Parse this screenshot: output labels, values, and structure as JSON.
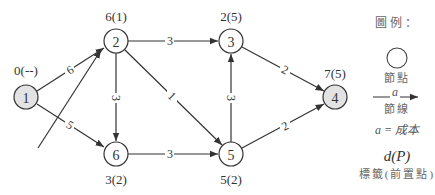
{
  "diagram": {
    "type": "shortest-path network",
    "nodes": [
      {
        "id": "1",
        "label": "1",
        "tag": "0(--)",
        "shaded": true
      },
      {
        "id": "2",
        "label": "2",
        "tag": "6(1)",
        "shaded": false
      },
      {
        "id": "3",
        "label": "3",
        "tag": "2(5)",
        "shaded": false
      },
      {
        "id": "4",
        "label": "4",
        "tag": "7(5)",
        "shaded": true
      },
      {
        "id": "5",
        "label": "5",
        "tag": "5(2)",
        "shaded": false
      },
      {
        "id": "6",
        "label": "6",
        "tag": "3(2)",
        "shaded": false
      }
    ],
    "edges": [
      {
        "from": "1",
        "to": "2",
        "weight": "6"
      },
      {
        "from": "1",
        "to": "6",
        "weight": "5"
      },
      {
        "from": "2",
        "to": "3",
        "weight": "3"
      },
      {
        "from": "2",
        "to": "6",
        "weight": "3"
      },
      {
        "from": "2",
        "to": "5",
        "weight": "1"
      },
      {
        "from": "6",
        "to": "5",
        "weight": "3"
      },
      {
        "from": "5",
        "to": "3",
        "weight": "3"
      },
      {
        "from": "3",
        "to": "4",
        "weight": "2"
      },
      {
        "from": "5",
        "to": "4",
        "weight": "2"
      }
    ]
  },
  "legend": {
    "title": "圖例：",
    "node_label": "節點",
    "arc_symbol": "a",
    "arc_label": "節線",
    "cost_label": "a = 成本",
    "tag_symbol": "d(P)",
    "tag_label": "標籤(前置點)"
  },
  "colors": {
    "shaded_node": "#e3e3e3",
    "stroke": "#333333"
  }
}
